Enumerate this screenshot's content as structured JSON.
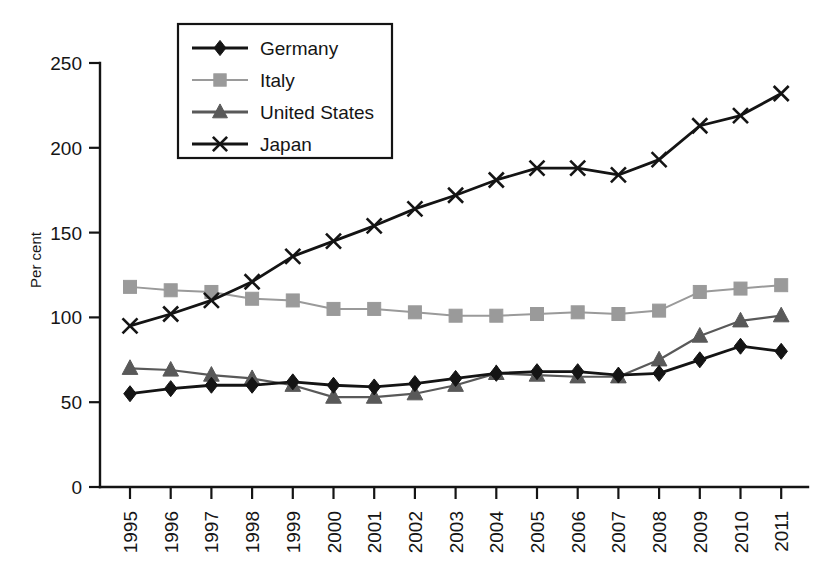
{
  "chart_data": {
    "type": "line",
    "title": "",
    "xlabel": "",
    "ylabel": "Per cent",
    "ylim": [
      0,
      250
    ],
    "yticks": [
      0,
      50,
      100,
      150,
      200,
      250
    ],
    "grid": false,
    "legend_position": "top-center",
    "categories": [
      "1995",
      "1996",
      "1997",
      "1998",
      "1999",
      "2000",
      "2001",
      "2002",
      "2003",
      "2004",
      "2005",
      "2006",
      "2007",
      "2008",
      "2009",
      "2010",
      "2011"
    ],
    "series": [
      {
        "name": "Germany",
        "marker": "diamond",
        "color": "#141414",
        "values": [
          55,
          58,
          60,
          60,
          62,
          60,
          59,
          61,
          64,
          67,
          68,
          68,
          66,
          67,
          75,
          83,
          80
        ]
      },
      {
        "name": "Italy",
        "marker": "square",
        "color": "#9a9a9a",
        "values": [
          118,
          116,
          115,
          111,
          110,
          105,
          105,
          103,
          101,
          101,
          102,
          103,
          102,
          104,
          115,
          117,
          119
        ]
      },
      {
        "name": "United States",
        "marker": "triangle",
        "color": "#595959",
        "values": [
          70,
          69,
          66,
          64,
          60,
          53,
          53,
          55,
          60,
          67,
          66,
          65,
          65,
          75,
          89,
          98,
          101
        ]
      },
      {
        "name": "Japan",
        "marker": "cross",
        "color": "#141414",
        "values": [
          95,
          102,
          110,
          121,
          136,
          145,
          154,
          164,
          172,
          181,
          188,
          188,
          184,
          193,
          213,
          219,
          232
        ]
      }
    ]
  },
  "legend": {
    "items": [
      {
        "label": "Germany",
        "marker": "diamond",
        "color": "#141414"
      },
      {
        "label": "Italy",
        "marker": "square",
        "color": "#9a9a9a"
      },
      {
        "label": "United States",
        "marker": "triangle",
        "color": "#595959"
      },
      {
        "label": "Japan",
        "marker": "cross",
        "color": "#141414"
      }
    ]
  },
  "axes": {
    "y_title": "Per cent",
    "y_tick_labels": [
      "250",
      "200",
      "150",
      "100",
      "50",
      "0"
    ],
    "x_tick_labels": [
      "1995",
      "1996",
      "1997",
      "1998",
      "1999",
      "2000",
      "2001",
      "2002",
      "2003",
      "2004",
      "2005",
      "2006",
      "2007",
      "2008",
      "2009",
      "2010",
      "2011"
    ]
  }
}
